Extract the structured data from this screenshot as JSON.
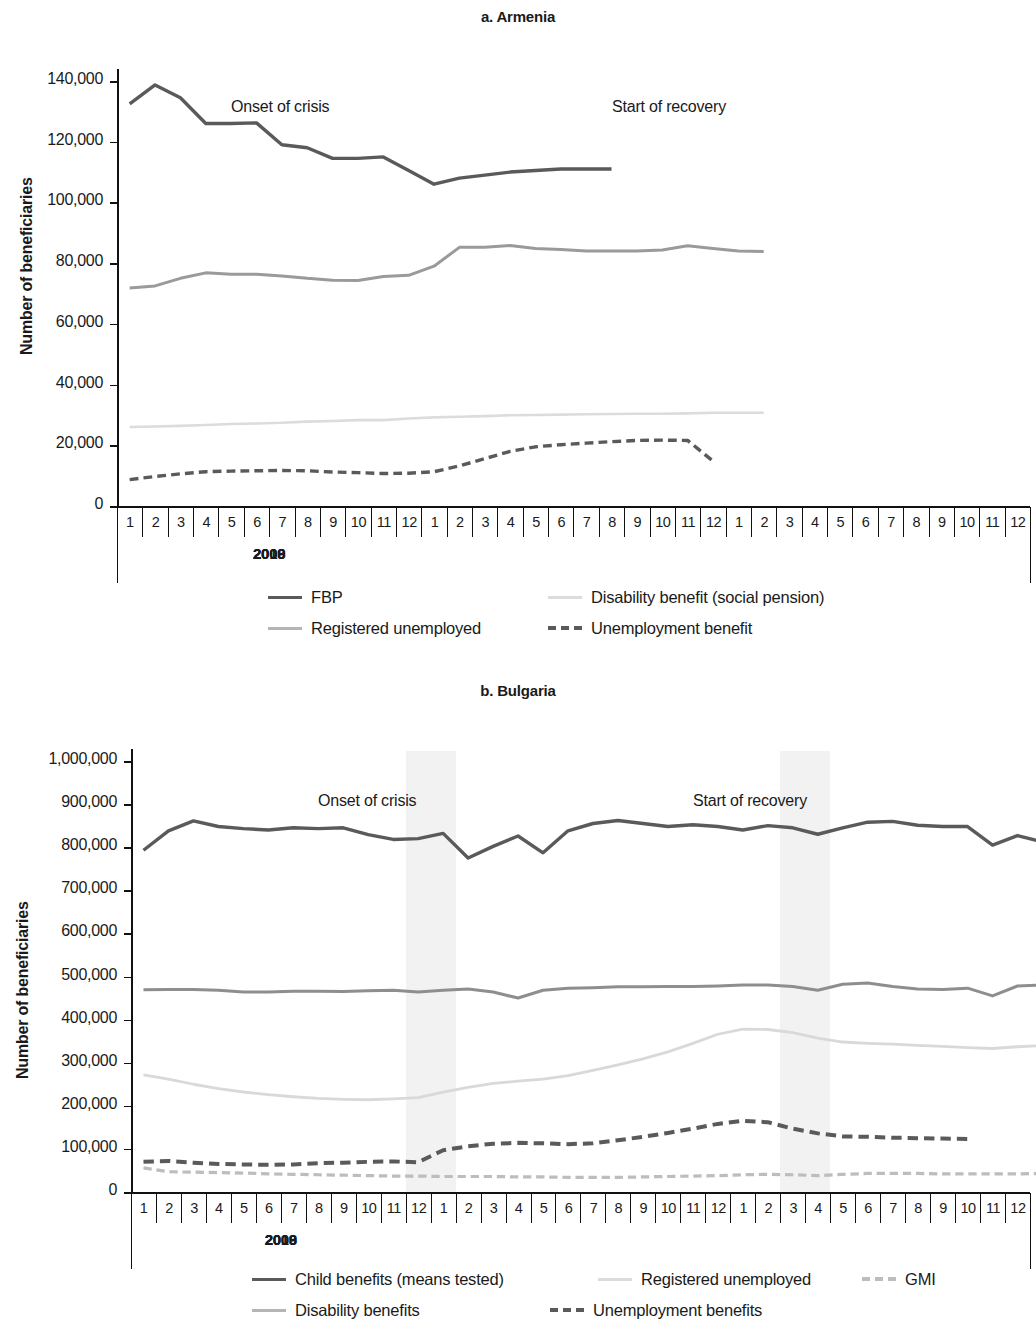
{
  "colors": {
    "dark": "#5a5a5a",
    "mid": "#9a9a9a",
    "light": "#d9d9d9",
    "dashed_dark": "#5a5a5a",
    "dashed_light": "#bdbdbd",
    "axis": "#111111",
    "band": "#f2f2f2"
  },
  "chart_data": [
    {
      "type": "line",
      "title": "a. Armenia",
      "xlabel": "",
      "ylabel": "Number of beneficiaries",
      "ylim": [
        0,
        140000
      ],
      "ytick_labels": [
        "0",
        "20,000",
        "40,000",
        "60,000",
        "80,000",
        "100,000",
        "120,000",
        "140,000"
      ],
      "ytick_values": [
        0,
        20000,
        40000,
        60000,
        80000,
        100000,
        120000,
        140000
      ],
      "grid": false,
      "legend_position": "below",
      "year_groups": [
        {
          "year": "2008",
          "months": [
            "1",
            "2",
            "3",
            "4",
            "5",
            "6",
            "7",
            "8",
            "9",
            "10",
            "11",
            "12"
          ]
        },
        {
          "year": "2009",
          "months": [
            "1",
            "2",
            "3",
            "4",
            "5",
            "6",
            "7",
            "8",
            "9",
            "10",
            "11",
            "12"
          ]
        },
        {
          "year": "2010",
          "months": [
            "1",
            "2",
            "3",
            "4",
            "5",
            "6",
            "7",
            "8",
            "9",
            "10",
            "11",
            "12"
          ]
        }
      ],
      "annotations": [
        {
          "text": "Onset of crisis",
          "x_month": 4,
          "y": 131000
        },
        {
          "text": "Start of recovery",
          "x_month": 19,
          "y": 131000
        }
      ],
      "x_count": 36,
      "series": [
        {
          "name": "FBP",
          "style": "solid",
          "color": "#5a5a5a",
          "width": 3.4,
          "values": [
            132500,
            138700,
            134500,
            126000,
            126000,
            126200,
            119000,
            118000,
            114500,
            114500,
            115000,
            110500,
            106000,
            108000,
            109000,
            110000,
            110500,
            111000,
            111000,
            111000,
            null,
            null,
            null,
            null,
            null,
            null,
            null,
            null,
            null,
            null,
            null,
            null,
            null,
            null,
            null,
            null
          ]
        },
        {
          "name": "Registered unemployed",
          "style": "solid",
          "color": "#9a9a9a",
          "width": 3.0,
          "values": [
            71800,
            72500,
            75000,
            76800,
            76300,
            76300,
            75800,
            75000,
            74400,
            74300,
            75600,
            76000,
            79000,
            85200,
            85200,
            85800,
            84800,
            84500,
            84000,
            84000,
            84000,
            84300,
            85700,
            84800,
            84000,
            83800,
            null,
            null,
            null,
            null,
            null,
            null,
            null,
            null,
            null,
            null
          ]
        },
        {
          "name": "Disability benefit (social pension)",
          "style": "solid",
          "color": "#dcdcdc",
          "width": 2.6,
          "values": [
            26000,
            26200,
            26400,
            26700,
            27000,
            27200,
            27400,
            27800,
            28000,
            28300,
            28300,
            28800,
            29200,
            29400,
            29600,
            29900,
            30000,
            30100,
            30200,
            30300,
            30400,
            30400,
            30500,
            30700,
            30700,
            30700,
            null,
            null,
            null,
            null,
            null,
            null,
            null,
            null,
            null,
            null
          ]
        },
        {
          "name": "Unemployment benefit",
          "style": "dashed",
          "color": "#5a5a5a",
          "width": 3.4,
          "values": [
            8700,
            9700,
            10600,
            11300,
            11500,
            11600,
            11700,
            11600,
            11200,
            11000,
            10700,
            10800,
            11300,
            13200,
            15600,
            18000,
            19500,
            20200,
            20700,
            21200,
            21600,
            21700,
            21600,
            14800,
            null,
            null,
            null,
            null,
            null,
            null,
            null,
            null,
            null,
            null,
            null,
            null
          ]
        }
      ],
      "legend": [
        {
          "label": "FBP",
          "style": "solid",
          "color": "#5a5a5a"
        },
        {
          "label": "Disability benefit (social pension)",
          "style": "solid",
          "color": "#dcdcdc"
        },
        {
          "label": "Registered unemployed",
          "style": "solid",
          "color": "#b5b5b5"
        },
        {
          "label": "Unemployment benefit",
          "style": "dashed",
          "color": "#5a5a5a"
        }
      ]
    },
    {
      "type": "line",
      "title": "b. Bulgaria",
      "xlabel": "",
      "ylabel": "Number of beneficiaries",
      "ylim": [
        0,
        1000000
      ],
      "ytick_labels": [
        "0",
        "100,000",
        "200,000",
        "300,000",
        "400,000",
        "500,000",
        "600,000",
        "700,000",
        "800,000",
        "900,000",
        "1,000,000"
      ],
      "ytick_values": [
        0,
        100000,
        200000,
        300000,
        400000,
        500000,
        600000,
        700000,
        800000,
        900000,
        1000000
      ],
      "grid": false,
      "legend_position": "below",
      "year_groups": [
        {
          "year": "2008",
          "months": [
            "1",
            "2",
            "3",
            "4",
            "5",
            "6",
            "7",
            "8",
            "9",
            "10",
            "11",
            "12"
          ]
        },
        {
          "year": "2009",
          "months": [
            "1",
            "2",
            "3",
            "4",
            "5",
            "6",
            "7",
            "8",
            "9",
            "10",
            "11",
            "12"
          ]
        },
        {
          "year": "2010",
          "months": [
            "1",
            "2",
            "3",
            "4",
            "5",
            "6",
            "7",
            "8",
            "9",
            "10",
            "11",
            "12"
          ]
        }
      ],
      "annotations": [
        {
          "text": "Onset of crisis",
          "x_month": 7,
          "y": 905000
        },
        {
          "text": "Start of recovery",
          "x_month": 22,
          "y": 905000
        }
      ],
      "shaded_bands": [
        {
          "start_month": 11.0,
          "end_month": 13.0
        },
        {
          "start_month": 26.0,
          "end_month": 28.0
        }
      ],
      "x_count": 36,
      "series": [
        {
          "name": "Child benefits (means tested)",
          "style": "solid",
          "color": "#5a5a5a",
          "width": 3.4,
          "values": [
            793000,
            838000,
            861000,
            848000,
            843000,
            840000,
            845000,
            843000,
            845000,
            829000,
            818000,
            820000,
            832000,
            775000,
            802000,
            826000,
            787000,
            838000,
            855000,
            862000,
            855000,
            848000,
            852000,
            848000,
            840000,
            850000,
            845000,
            830000,
            845000,
            858000,
            860000,
            851000,
            848000,
            848000,
            805000,
            827000,
            812000
          ]
        },
        {
          "name": "Disability benefits",
          "style": "solid",
          "color": "#8e8e8e",
          "width": 3.0,
          "values": [
            469000,
            470000,
            470000,
            468000,
            464000,
            464000,
            466000,
            466000,
            465000,
            467000,
            468000,
            464000,
            468000,
            471000,
            464000,
            450000,
            468000,
            473000,
            474000,
            476000,
            476000,
            477000,
            477000,
            478000,
            480000,
            480000,
            477000,
            468000,
            482000,
            485000,
            477000,
            471000,
            470000,
            473000,
            455000,
            478000,
            480000
          ]
        },
        {
          "name": "Registered unemployed",
          "style": "solid",
          "color": "#d9d9d9",
          "width": 2.8,
          "values": [
            272000,
            262000,
            250000,
            240000,
            232000,
            226000,
            221000,
            217000,
            215000,
            214000,
            216000,
            219000,
            232000,
            243000,
            252000,
            257000,
            262000,
            270000,
            282000,
            295000,
            309000,
            325000,
            345000,
            366000,
            378000,
            377000,
            370000,
            357000,
            348000,
            345000,
            343000,
            340000,
            338000,
            335000,
            333000,
            337000,
            340000
          ]
        },
        {
          "name": "Unemployment benefits",
          "style": "dashed",
          "color": "#5a5a5a",
          "width": 4.0,
          "values": [
            70000,
            72000,
            68000,
            65000,
            64000,
            63000,
            64000,
            67000,
            68000,
            70000,
            71000,
            69000,
            97000,
            106000,
            112000,
            114000,
            113000,
            111000,
            113000,
            120000,
            128000,
            137000,
            147000,
            158000,
            165000,
            162000,
            147000,
            136000,
            129000,
            128000,
            126000,
            125000,
            124000,
            123000,
            null,
            null,
            null
          ]
        },
        {
          "name": "GMI",
          "style": "dashed",
          "color": "#bdbdbd",
          "width": 3.2,
          "values": [
            56000,
            47000,
            46000,
            45000,
            44000,
            42000,
            41000,
            40000,
            39000,
            38000,
            37000,
            37000,
            36000,
            36000,
            36000,
            35000,
            35000,
            34000,
            34000,
            34000,
            35000,
            36000,
            37000,
            38000,
            40000,
            41000,
            40000,
            38000,
            41000,
            43000,
            43000,
            43000,
            42000,
            42000,
            42000,
            42000,
            43000
          ]
        }
      ],
      "legend": [
        {
          "label": "Child benefits (means tested)",
          "style": "solid",
          "color": "#5a5a5a"
        },
        {
          "label": "Registered unemployed",
          "style": "solid",
          "color": "#dcdcdc"
        },
        {
          "label": "GMI",
          "style": "dashed",
          "color": "#bdbdbd"
        },
        {
          "label": "Disability benefits",
          "style": "solid",
          "color": "#b5b5b5"
        },
        {
          "label": "Unemployment benefits",
          "style": "dashed",
          "color": "#5a5a5a"
        }
      ]
    }
  ]
}
